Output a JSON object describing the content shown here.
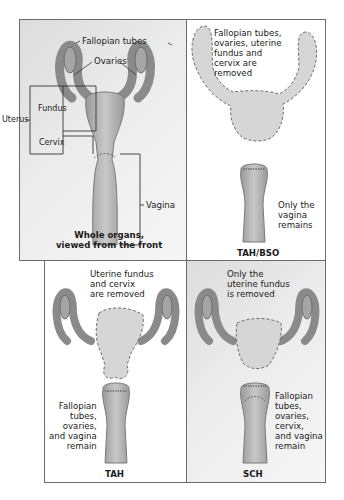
{
  "panels": {
    "whole": {
      "labels": {
        "fallopian_tubes": "Fallopian tubes",
        "ovaries": "Ovaries",
        "uterus": "Uterus",
        "fundus": "Fundus",
        "cervix": "Cervix",
        "vagina": "Vagina"
      },
      "caption": "Whole organs,\nviewed from the front"
    },
    "tah_bso": {
      "note": "Fallopian tubes,\novaries, uterine\nfundus and\ncervix are\nremoved",
      "remains": "Only the\nvagina\nremains",
      "caption": "TAH/BSO"
    },
    "tah": {
      "note": "Uterine fundus\nand cervix\nare removed",
      "remains": "Fallopian\ntubes,\novaries,\nand vagina\nremain",
      "caption": "TAH"
    },
    "sch": {
      "note": "Only the\nuterine fundus\nis removed",
      "remains": "Fallopian\ntubes,\novaries,\ncervix,\nand vagina\nremain",
      "caption": "SCH"
    }
  },
  "colors": {
    "organ_fill": "#b9b9b9",
    "organ_stroke": "#7a7a7a",
    "removed_fill": "#d6d6d6",
    "border": "#6b6b6b"
  }
}
